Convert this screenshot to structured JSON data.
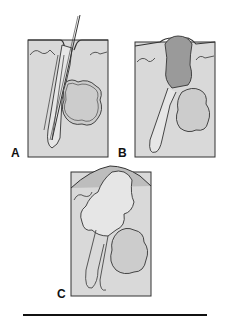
{
  "figure": {
    "panels": [
      {
        "label": "A",
        "description": "Normal pilosebaceous unit with hair shaft and sebaceous gland"
      },
      {
        "label": "B",
        "description": "Follicle plugged with dark keratin/sebum (comedo)"
      },
      {
        "label": "C",
        "description": "Enlarged distended follicle raising skin surface"
      }
    ],
    "colors": {
      "tissue": "#d9d9d9",
      "gland": "#cccccc",
      "plug": "#9a9a9a",
      "outline": "#333333",
      "surface": "#bdbdbd"
    }
  }
}
